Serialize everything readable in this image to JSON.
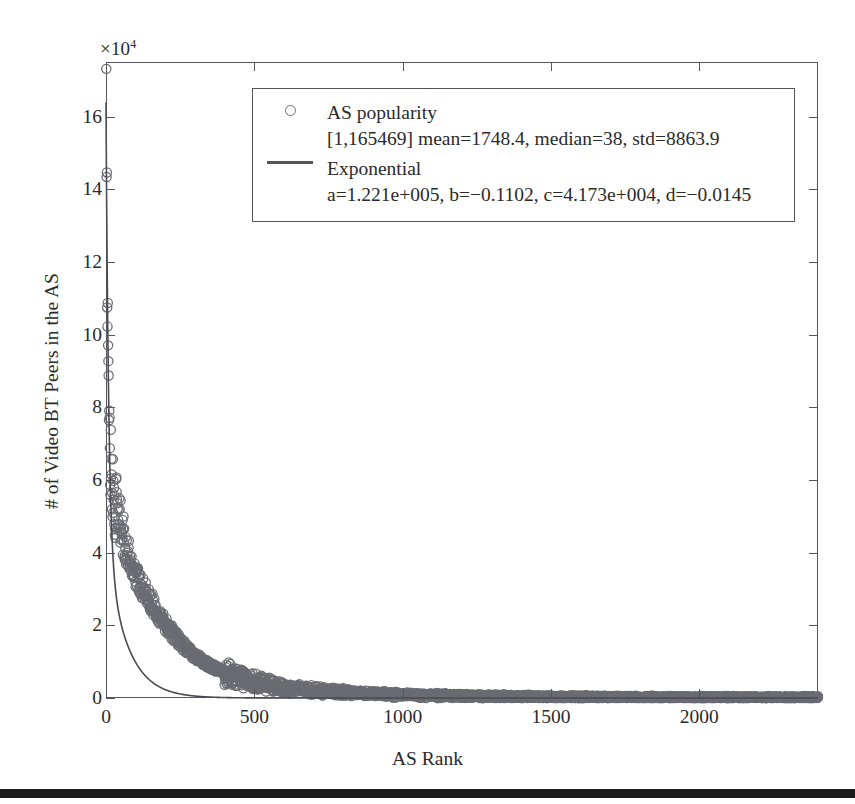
{
  "figure": {
    "y_exponent_prefix": "×10",
    "y_exponent_power": "4"
  },
  "axes": {
    "x_title": "AS Rank",
    "y_title": "# of Video BT Peers in the AS",
    "x_ticks": [
      "0",
      "500",
      "1000",
      "1500",
      "2000"
    ],
    "y_ticks": [
      "0",
      "2",
      "4",
      "6",
      "8",
      "10",
      "12",
      "14",
      "16"
    ]
  },
  "legend": {
    "entries": [
      {
        "marker": "open-circle",
        "label": "AS popularity",
        "detail": "[1,165469] mean=1748.4, median=38, std=8863.9"
      },
      {
        "marker": "line",
        "label": "Exponential",
        "detail": "a=1.221e+005, b=−0.1102, c=4.173e+004, d=−0.0145"
      }
    ]
  },
  "colors": {
    "axis": "#55555c",
    "marker": "#6b6b72",
    "fit_line": "#4a4a52",
    "background": "#ffffff",
    "scan_bar": "#1b1b1b"
  },
  "chart_data": {
    "type": "scatter",
    "title": "",
    "xlabel": "AS Rank",
    "ylabel": "# of Video BT Peers in the AS",
    "xlim": [
      0,
      2400
    ],
    "ylim": [
      0,
      175000
    ],
    "y_axis_multiplier": 10000,
    "grid": false,
    "legend_position": "top-center",
    "series": [
      {
        "name": "AS popularity",
        "type": "scatter",
        "marker": "open-circle",
        "stats": {
          "range_min": 1,
          "range_max": 165469,
          "mean": 1748.4,
          "median": 38,
          "std": 8863.9
        },
        "n_points": 2400,
        "x_sample": [
          1,
          2,
          3,
          4,
          5,
          6,
          7,
          8,
          9,
          10,
          12,
          14,
          16,
          18,
          20,
          25,
          30,
          35,
          40,
          50,
          60,
          70,
          80,
          90,
          100,
          120,
          140,
          160,
          180,
          200,
          250,
          300,
          350,
          400,
          500,
          600,
          800,
          1000,
          1200,
          1500,
          1800,
          2100,
          2400
        ],
        "y_sample": [
          165469,
          128000,
          127000,
          126500,
          114500,
          101500,
          98000,
          96500,
          87000,
          74500,
          71000,
          68000,
          66500,
          63000,
          61000,
          54500,
          53000,
          52000,
          50000,
          46500,
          43000,
          40500,
          38500,
          36000,
          34000,
          31000,
          28000,
          25500,
          23000,
          20500,
          15500,
          11500,
          9000,
          7000,
          4500,
          3000,
          1600,
          900,
          560,
          300,
          170,
          95,
          55
        ]
      },
      {
        "name": "Exponential",
        "type": "line",
        "equation": "y = a*exp(b*x) + c*exp(d*x)",
        "coefficients": {
          "a": 122100,
          "b": -0.1102,
          "c": 41730,
          "d": -0.0145
        },
        "coefficients_display": "a=1.221e+005, b=−0.1102, c=4.173e+004, d=−0.0145"
      }
    ]
  }
}
